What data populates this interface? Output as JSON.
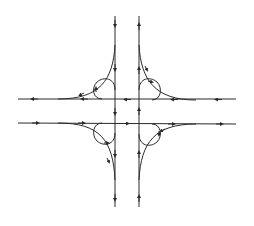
{
  "diagram": {
    "stroke_color": "#2a2a2a",
    "background": "#ffffff",
    "roads": {
      "vertical_southbound": {
        "x": 115,
        "y1": 16,
        "y2": 207,
        "direction": "down"
      },
      "vertical_northbound": {
        "x": 139,
        "y1": 16,
        "y2": 207,
        "direction": "up"
      },
      "horizontal_westbound": {
        "y": 99,
        "x1": 18,
        "x2": 236,
        "direction": "left"
      },
      "horizontal_eastbound": {
        "y": 123,
        "x1": 18,
        "x2": 236,
        "direction": "right"
      }
    },
    "loops": [
      "top-left",
      "top-right",
      "bottom-left",
      "bottom-right"
    ],
    "outer_ramps": [
      "top-left",
      "top-right",
      "bottom-left",
      "bottom-right"
    ]
  }
}
